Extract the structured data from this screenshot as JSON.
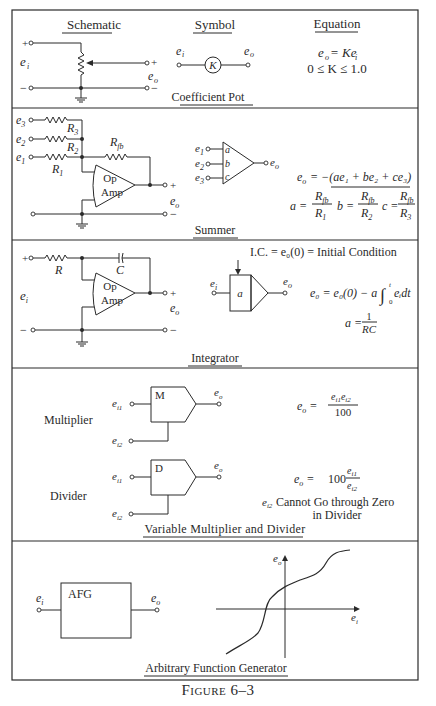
{
  "figure": {
    "caption": "Figure 6–3"
  },
  "sections": [
    {
      "id": "coefficient-pot",
      "title": "Coefficient Pot",
      "headers": {
        "schematic": "Schematic",
        "symbol": "Symbol",
        "equation": "Equation"
      },
      "schematic": {
        "input_label": "e",
        "input_sub": "i",
        "output_label": "e",
        "output_sub": "o",
        "plus": "+",
        "minus": "−"
      },
      "symbol": {
        "in": "e",
        "in_sub": "i",
        "out": "e",
        "out_sub": "o",
        "block": "K"
      },
      "equation": {
        "line1": "e_o = Ke_i",
        "line2": "0 ≤ K ≤ 1.0"
      }
    },
    {
      "id": "summer",
      "title": "Summer",
      "schematic": {
        "inputs": [
          "e3",
          "e2",
          "e1"
        ],
        "resistors": [
          "R3",
          "R2",
          "R1"
        ],
        "feedback": "Rfb",
        "opamp": [
          "Op",
          "Amp"
        ],
        "output": "eo"
      },
      "symbol": {
        "inputs": [
          "e1",
          "e2",
          "e3"
        ],
        "gains": [
          "a",
          "b",
          "c"
        ],
        "output": "eo"
      },
      "equation": {
        "line1": "e_o = −(ae_1 + be_2 + ce_3)",
        "a": "a = R_fb / R_1",
        "b": "b = R_fb / R_2",
        "c": "c = R_fb / R_3"
      }
    },
    {
      "id": "integrator",
      "title": "Integrator",
      "schematic": {
        "input": "ei",
        "resistor": "R",
        "capacitor": "C",
        "opamp": [
          "Op",
          "Amp"
        ],
        "output": "eo"
      },
      "symbol": {
        "in": "ei",
        "block": "a",
        "out": "eo"
      },
      "equation": {
        "ic": "I.C. = e0(0) = Initial Condition",
        "main": "e0 = e0(0) − a ∫0t ei dt",
        "a": "a = 1/RC"
      }
    },
    {
      "id": "multiplier-divider",
      "title": "Variable Multiplier and Divider",
      "multiplier": {
        "label": "Multiplier",
        "block": "M",
        "in1": "ei1",
        "in2": "ei2",
        "out": "eo",
        "equation": "e_o = e_i1 e_i2 / 100"
      },
      "divider": {
        "label": "Divider",
        "block": "D",
        "in1": "ei1",
        "in2": "ei2",
        "out": "eo",
        "equation": "e_o = 100 e_i1 / e_i2",
        "note1": "Cannot Go through Zero",
        "note2": "in Divider",
        "note_var": "e",
        "note_sub": "i2"
      }
    },
    {
      "id": "afg",
      "title": "Arbitrary Function Generator",
      "block": "AFG",
      "in": "ei",
      "out": "eo",
      "plot": {
        "x_axis": "ei",
        "y_axis": "eo"
      }
    }
  ],
  "text": {
    "schematic": "Schematic",
    "symbol": "Symbol",
    "equation": "Equation",
    "coefficient_pot": "Coefficient Pot",
    "summer": "Summer",
    "integrator": "Integrator",
    "mult_div": "Variable Multiplier  and  Divider",
    "afg_title": "Arbitrary Function Generator",
    "e": "e",
    "i": "i",
    "o": "o",
    "K": "K",
    "plus": "+",
    "minus": "−",
    "eq_pot_1a": "e",
    "eq_pot_1b": " = Ke",
    "eq_pot_2": "0 ≤ K ≤ 1.0",
    "op": "Op",
    "amp": "Amp",
    "R": "R",
    "C": "C",
    "fb": "fb",
    "a": "a",
    "b": "b",
    "c": "c",
    "sum_eq": "= −(ae₁ + be₂ + ce₃)",
    "ic": "I.C. = e₀(0) = Initial Condition",
    "int_eq": "e₀ = e₀(0) − a",
    "int_eq2": "eᵢdt",
    "one": "1",
    "RC": "RC",
    "a_eq": "a =",
    "M": "M",
    "D": "D",
    "multiplier": "Multiplier",
    "divider": "Divider",
    "hundred": "100",
    "mul_num": "eᵢ₁eᵢ₂",
    "div_num": "eᵢ₁",
    "div_den": "eᵢ₂",
    "note1": "Cannot Go through Zero",
    "note2": "in Divider",
    "AFG": "AFG",
    "t": "t",
    "zero": "0"
  }
}
